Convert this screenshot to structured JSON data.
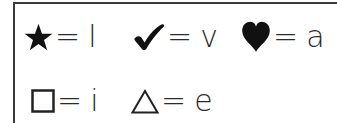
{
  "key": {
    "rows": [
      {
        "entries": [
          {
            "symbol": "star-icon",
            "equals": "=",
            "letter": "l"
          },
          {
            "symbol": "checkmark-icon",
            "equals": "=",
            "letter": "v"
          },
          {
            "symbol": "heart-icon",
            "equals": "=",
            "letter": "a"
          }
        ]
      },
      {
        "entries": [
          {
            "symbol": "square-icon",
            "equals": "=",
            "letter": "i"
          },
          {
            "symbol": "triangle-icon",
            "equals": "=",
            "letter": "e"
          }
        ]
      }
    ]
  },
  "colors": {
    "ink": "#1e1e1e",
    "border": "#3a3a3a",
    "background": "#ffffff"
  }
}
